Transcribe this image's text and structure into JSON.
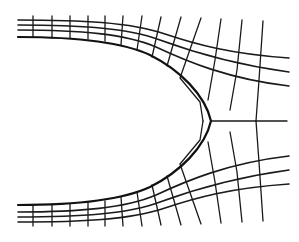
{
  "figure": {
    "colors": {
      "background": "#ffffff",
      "line": "#1a1a1a",
      "boundary": "#111111"
    },
    "stroke": {
      "grid": 1.3,
      "boundary": 2.2
    },
    "boundary": "M18,37 C70,37 120,41 150,55 C180,70 205,95 211,121 C205,147 180,172 150,187 C120,201 70,205 18,205",
    "streamlines_top": [
      "M18,20 C80,20 130,22 165,34 C195,44 230,54 289,58",
      "M18,25 C80,25 128,28 160,40 C190,51 230,64 289,72",
      "M18,30 C80,30 126,34 156,47 C186,61 228,79 289,86"
    ],
    "streamlines_bottom": [
      "M18,222 C80,222 130,220 165,208 C195,198 230,188 289,184",
      "M18,217 C80,217 128,214 160,202 C190,191 230,178 289,170",
      "M18,212 C80,212 126,208 156,195 C186,181 228,163 289,156"
    ],
    "axis_line": "M211,121 L287,121",
    "equipotentials_top": [
      "M33,16 L33,37",
      "M52,16 L52,38",
      "M70,16 L70,38",
      "M88,16 L88,39",
      "M105,16 L105,41",
      "M123,16 L121,45",
      "M142,16 L137,50",
      "M161,17 L152,57",
      "M181,17 L167,66",
      "M201,18 L180,78 L200,102 L203,121",
      "M221,19 L215,60 L208,100",
      "M242,20 L237,70 L230,110",
      "M263,21 L259,80 L256,121"
    ],
    "equipotentials_bottom": [
      "M33,226 L33,205",
      "M52,226 L52,204",
      "M70,226 L70,204",
      "M88,226 L88,203",
      "M105,226 L105,201",
      "M123,226 L121,197",
      "M142,226 L137,192",
      "M161,225 L152,185",
      "M181,225 L167,176",
      "M201,224 L180,164 L200,140 L203,121",
      "M221,223 L215,182 L208,142",
      "M242,222 L237,172 L230,132",
      "M263,221 L259,162 L256,121"
    ]
  }
}
